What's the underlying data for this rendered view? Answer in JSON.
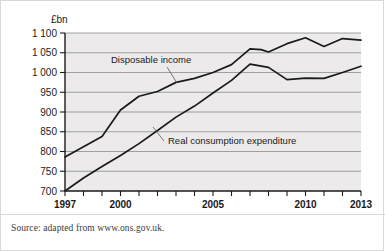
{
  "source_note": "Source: adapted from www.ons.gov.uk.",
  "colors": {
    "plot_background": "#eceaea",
    "gridline": "#8c8c8c",
    "series_line": "#1a1a1a",
    "axis": "#1a1a1a",
    "card_border": "#d8d8d8"
  },
  "annotations": [
    {
      "text": "Disposable income",
      "x": 110,
      "y": 62
    },
    {
      "text": "Real consumption expenditure",
      "x": 167,
      "y": 143
    }
  ],
  "chart_data": {
    "type": "line",
    "title": "",
    "subtitle": "",
    "xlabel": "",
    "ylabel": "£bn",
    "unit_label": "£bn",
    "grid": true,
    "legend_position": "inline-annotation",
    "xlim": [
      1997,
      2013
    ],
    "ylim": [
      700,
      1100
    ],
    "ytick_step": 50,
    "x": [
      1997,
      1998,
      1999,
      2000,
      2001,
      2002,
      2003,
      2004,
      2005,
      2006,
      2007,
      2008,
      2009,
      2010,
      2011,
      2012,
      2013
    ],
    "xticks": [
      1997,
      1998,
      1999,
      2000,
      2001,
      2002,
      2003,
      2004,
      2005,
      2006,
      2007,
      2008,
      2009,
      2010,
      2011,
      2012,
      2013
    ],
    "xtick_labels": [
      "1997",
      "",
      "",
      "2000",
      "",
      "",
      "",
      "",
      "2005",
      "",
      "",
      "",
      "",
      "2010",
      "",
      "",
      "2013"
    ],
    "yticks": [
      700,
      750,
      800,
      850,
      900,
      950,
      1000,
      1050,
      1100
    ],
    "ytick_labels": [
      "700",
      "750",
      "800",
      "850",
      "900",
      "950",
      "1 000",
      "1 050",
      "1 100"
    ],
    "series": [
      {
        "name": "Disposable income",
        "values": [
          786,
          800,
          815,
          838,
          883,
          921,
          940,
          955,
          975,
          985,
          1000,
          1014,
          1028,
          1047,
          1061,
          1053,
          1054
        ]
      },
      {
        "name": "Real consumption expenditure",
        "values": [
          700,
          722,
          746,
          770,
          793,
          815,
          836,
          858,
          882,
          905,
          930,
          952,
          972,
          990,
          1008,
          1021,
          1015
        ]
      }
    ],
    "series_rendered": [
      {
        "name": "Disposable income",
        "x": [
          1997,
          1998,
          1999,
          2000,
          2001,
          2002,
          2003,
          2004,
          2005,
          2006,
          2007,
          2007.6,
          2008,
          2009,
          2010,
          2011,
          2012,
          2013
        ],
        "values": [
          786,
          812,
          838,
          905,
          940,
          952,
          975,
          985,
          1000,
          1020,
          1060,
          1058,
          1052,
          1073,
          1088,
          1066,
          1086,
          1082
        ]
      },
      {
        "name": "Real consumption expenditure",
        "x": [
          1997,
          1998,
          1999,
          2000,
          2001,
          2002,
          2003,
          2004,
          2005,
          2006,
          2007,
          2008,
          2009,
          2010,
          2011,
          2012,
          2013
        ],
        "values": [
          700,
          733,
          762,
          790,
          820,
          853,
          887,
          915,
          948,
          980,
          1021,
          1013,
          982,
          986,
          985,
          1000,
          1016
        ]
      }
    ]
  }
}
